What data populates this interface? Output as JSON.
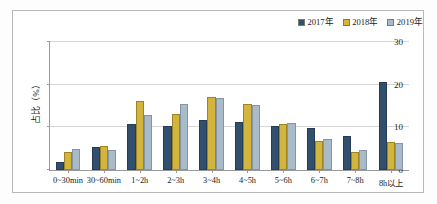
{
  "chart_data": {
    "type": "bar",
    "title": "",
    "xlabel": "",
    "ylabel": "占比（%）",
    "ylim": [
      0,
      30
    ],
    "yticks": [
      "0",
      "10",
      "20",
      "30"
    ],
    "ytick_values": [
      0,
      10,
      20,
      30
    ],
    "grid": true,
    "legend_position": "top-right",
    "categories": [
      "0~30min",
      "30~60min",
      "1~2h",
      "2~3h",
      "3~4h",
      "4~5h",
      "5~6h",
      "6~7h",
      "7~8h",
      "8h以上"
    ],
    "series": [
      {
        "name": "2017年",
        "color": "#32506e",
        "values": [
          1.9,
          5.3,
          10.8,
          10.2,
          11.8,
          11.2,
          10.2,
          9.8,
          7.9,
          20.7
        ]
      },
      {
        "name": "2018年",
        "color": "#d3b43c",
        "values": [
          4.3,
          5.6,
          16.1,
          13.2,
          17.0,
          15.4,
          10.7,
          6.8,
          4.2,
          6.6
        ]
      },
      {
        "name": "2019年",
        "color": "#a9bac9",
        "values": [
          5.0,
          4.6,
          13.0,
          15.5,
          16.9,
          15.2,
          11.1,
          7.3,
          4.8,
          6.3
        ]
      }
    ]
  }
}
